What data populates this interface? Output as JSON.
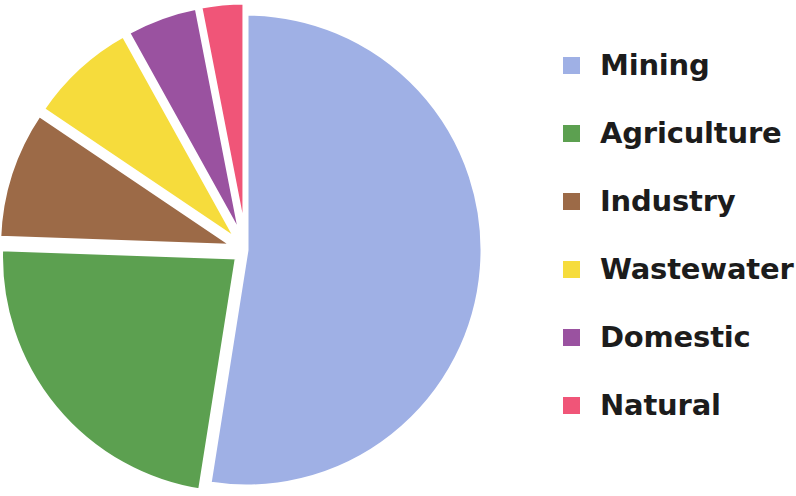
{
  "chart_data": {
    "type": "pie",
    "title": "",
    "subtitle": "",
    "xlabel": "",
    "ylabel": "",
    "grid": false,
    "legend_position": "right",
    "exploded": true,
    "start_angle_deg": 0,
    "direction": "clockwise",
    "categories": [
      "Mining",
      "Agriculture",
      "Industry",
      "Wastewater",
      "Domestic",
      "Natural"
    ],
    "values": [
      52.5,
      23.0,
      9.0,
      7.5,
      5.0,
      3.0
    ],
    "colors": [
      "#9fb0e5",
      "#5ca050",
      "#9c6a47",
      "#f6dc3c",
      "#9a52a0",
      "#f05578"
    ],
    "slices": [
      {
        "label": "Mining",
        "value": 52.5,
        "color": "#9fb0e5",
        "start_deg": 0.0,
        "end_deg": 189.0,
        "exploded": false
      },
      {
        "label": "Agriculture",
        "value": 23.0,
        "color": "#5ca050",
        "start_deg": 189.0,
        "end_deg": 272.0,
        "exploded": true
      },
      {
        "label": "Industry",
        "value": 9.0,
        "color": "#9c6a47",
        "start_deg": 272.0,
        "end_deg": 304.0,
        "exploded": true
      },
      {
        "label": "Wastewater",
        "value": 7.5,
        "color": "#f6dc3c",
        "start_deg": 304.0,
        "end_deg": 331.0,
        "exploded": true
      },
      {
        "label": "Domestic",
        "value": 5.0,
        "color": "#9a52a0",
        "start_deg": 331.0,
        "end_deg": 349.0,
        "exploded": true
      },
      {
        "label": "Natural",
        "value": 3.0,
        "color": "#f05578",
        "start_deg": 349.0,
        "end_deg": 360.0,
        "exploded": true
      }
    ]
  },
  "legend": {
    "items": [
      {
        "label": "Mining",
        "color": "#9fb0e5"
      },
      {
        "label": "Agriculture",
        "color": "#5ca050"
      },
      {
        "label": "Industry",
        "color": "#9c6a47"
      },
      {
        "label": "Wastewater",
        "color": "#f6dc3c"
      },
      {
        "label": "Domestic",
        "color": "#9a52a0"
      },
      {
        "label": "Natural",
        "color": "#f05578"
      }
    ]
  },
  "geometry": {
    "center_x": 246,
    "center_y": 250,
    "radius": 237,
    "explode_offset": 11,
    "legend_left": 555,
    "legend_swatch_x": 8,
    "legend_first_row_y": 48,
    "legend_row_step": 68
  }
}
